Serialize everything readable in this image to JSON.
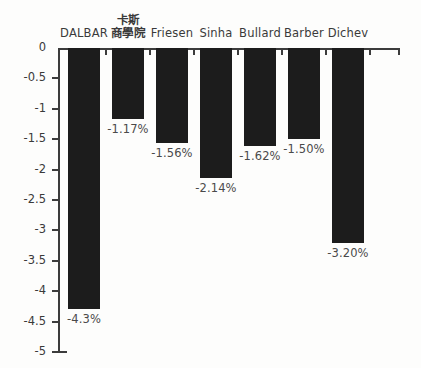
{
  "chart_data": {
    "type": "bar",
    "title": "",
    "xlabel": "",
    "ylabel": "",
    "grid": false,
    "legend": "none",
    "orientation": "vertical",
    "ylim": [
      -5,
      0
    ],
    "ytick_labels": [
      "0",
      "-0.5",
      "-1",
      "-1.5",
      "-2",
      "-2.5",
      "-3",
      "-3.5",
      "-4",
      "-4.5",
      "-5"
    ],
    "ytick_values": [
      0,
      -0.5,
      -1,
      -1.5,
      -2,
      -2.5,
      -3,
      -3.5,
      -4,
      -4.5,
      -5
    ],
    "categories": [
      "DALBAR",
      "卡斯商學院",
      "Friesen",
      "Sinha",
      "Bullard",
      "Barber",
      "Dichev"
    ],
    "category_lines": [
      [
        "DALBAR"
      ],
      [
        "卡斯",
        "商學院"
      ],
      [
        "Friesen"
      ],
      [
        "Sinha"
      ],
      [
        "Bullard"
      ],
      [
        "Barber"
      ],
      [
        "Dichev"
      ]
    ],
    "values": [
      -4.3,
      -1.17,
      -1.56,
      -2.14,
      -1.62,
      -1.5,
      -3.2
    ],
    "data_labels": [
      "-4.3%",
      "-1.17%",
      "-1.56%",
      "-2.14%",
      "-1.62%",
      "-1.50%",
      "-3.20%"
    ],
    "unit": "%",
    "colors": {
      "bar": "#1c1c1c",
      "axis": "#3c3c3c",
      "text": "#3a3a3a",
      "value_text": "#4a4a4a",
      "background": "#fdfdfc"
    }
  }
}
